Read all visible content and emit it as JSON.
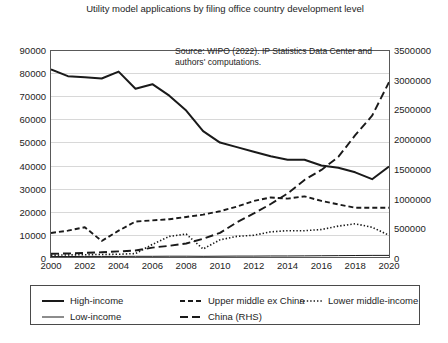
{
  "chart_data": {
    "type": "line",
    "title": "Utility model applications by filing office country development level",
    "annotation": "Source: WIPO (2022). IP Statistics Data Center and authors' computations.",
    "xlabel": "",
    "ylabel": "",
    "grid": true,
    "legend_position": "bottom",
    "x": [
      2000,
      2001,
      2002,
      2003,
      2004,
      2005,
      2006,
      2007,
      2008,
      2009,
      2010,
      2011,
      2012,
      2013,
      2014,
      2015,
      2016,
      2017,
      2018,
      2019,
      2020
    ],
    "xtick_labels": [
      "2000",
      "2002",
      "2004",
      "2006",
      "2008",
      "2010",
      "2012",
      "2014",
      "2016",
      "2018",
      "2020"
    ],
    "xlim": [
      2000,
      2020
    ],
    "ylim": [
      0,
      90000
    ],
    "ytick_labels": [
      "0",
      "10000",
      "20000",
      "30000",
      "40000",
      "50000",
      "60000",
      "70000",
      "80000",
      "90000"
    ],
    "y2lim": [
      0,
      3500000
    ],
    "y2tick_labels": [
      "0",
      "500000",
      "1000000",
      "1500000",
      "2000000",
      "2500000",
      "3000000",
      "3500000"
    ],
    "series": [
      {
        "name": "High-income",
        "axis": "left",
        "style": "solid-thick",
        "values": [
          82000,
          79000,
          78500,
          78000,
          81000,
          73500,
          75500,
          70500,
          64000,
          55000,
          50000,
          48000,
          46000,
          44000,
          42500,
          42500,
          40000,
          39000,
          37000,
          34000,
          39500
        ]
      },
      {
        "name": "Upper middle ex China",
        "axis": "left",
        "style": "dashed",
        "values": [
          10500,
          11500,
          13000,
          7000,
          11500,
          15500,
          16000,
          16500,
          17500,
          18500,
          20000,
          22000,
          24500,
          26000,
          25500,
          26500,
          24500,
          23000,
          21500,
          21500,
          21500
        ]
      },
      {
        "name": "Lower middle-income",
        "axis": "left",
        "style": "dotted",
        "values": [
          800,
          900,
          1000,
          1100,
          1200,
          1500,
          5500,
          9000,
          10000,
          3500,
          7500,
          9000,
          9500,
          11000,
          11500,
          11500,
          12000,
          13500,
          14500,
          13000,
          9500
        ]
      },
      {
        "name": "Low-income",
        "axis": "left",
        "style": "solid-thin",
        "values": [
          200,
          200,
          250,
          250,
          250,
          300,
          300,
          350,
          350,
          300,
          350,
          400,
          400,
          450,
          450,
          500,
          550,
          600,
          650,
          700,
          700
        ]
      },
      {
        "name": "China (RHS)",
        "axis": "right",
        "style": "long-dash",
        "values": [
          55000,
          60000,
          70000,
          80000,
          95000,
          110000,
          160000,
          190000,
          230000,
          310000,
          410000,
          590000,
          740000,
          900000,
          1080000,
          1310000,
          1480000,
          1700000,
          2070000,
          2400000,
          2970000
        ]
      }
    ]
  },
  "caption": ""
}
